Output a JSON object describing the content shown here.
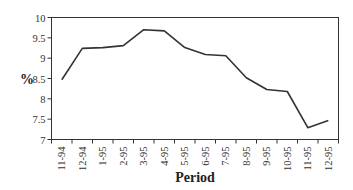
{
  "chart_data": {
    "type": "line",
    "title": "",
    "xlabel": "Period",
    "ylabel": "%",
    "categories": [
      "11-94",
      "12-94",
      "1-95",
      "2-95",
      "3-95",
      "4-95",
      "5-95",
      "6-95",
      "7-95",
      "8-95",
      "9-95",
      "10-95",
      "11-95",
      "12-95"
    ],
    "series": [
      {
        "name": "%",
        "values": [
          8.47,
          9.24,
          9.26,
          9.31,
          9.7,
          9.67,
          9.26,
          9.09,
          9.06,
          8.52,
          8.23,
          8.18,
          7.29,
          7.47
        ]
      }
    ],
    "ylim": [
      7,
      10
    ],
    "yticks": [
      7,
      7.5,
      8,
      8.5,
      9,
      9.5,
      10
    ],
    "ytick_labels": [
      "7",
      "7.5",
      "8",
      "8.5",
      "9",
      "9.5",
      "10"
    ],
    "grid": false,
    "legend": "none",
    "line_color": "#333333"
  }
}
